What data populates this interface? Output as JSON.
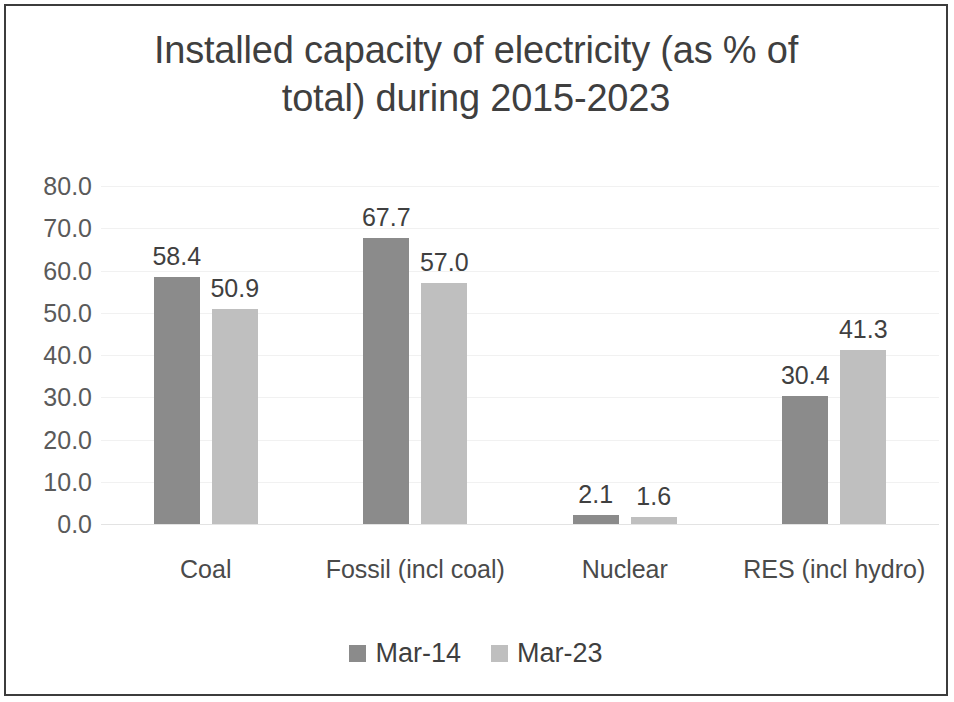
{
  "chart_data": {
    "type": "bar",
    "title": "Installed capacity of electricity (as % of total) during 2015-2023",
    "title_lines": [
      "Installed capacity of electricity (as % of",
      "total) during 2015-2023"
    ],
    "xlabel": "",
    "ylabel": "",
    "categories": [
      "Coal",
      "Fossil (incl coal)",
      "Nuclear",
      "RES (incl hydro)"
    ],
    "series": [
      {
        "name": "Mar-14",
        "color": "#8b8b8b",
        "values": [
          58.4,
          67.7,
          2.1,
          30.4
        ],
        "labels": [
          "58.4",
          "67.7",
          "2.1",
          "30.4"
        ]
      },
      {
        "name": "Mar-23",
        "color": "#bfbfbf",
        "values": [
          50.9,
          57.0,
          1.6,
          41.3
        ],
        "labels": [
          "50.9",
          "57.0",
          "1.6",
          "41.3"
        ]
      }
    ],
    "ylim": [
      0,
      80
    ],
    "ytick_step": 10,
    "ytick_labels": [
      "80.0",
      "70.0",
      "60.0",
      "50.0",
      "40.0",
      "30.0",
      "20.0",
      "10.0",
      "0.0"
    ],
    "ytick_values": [
      80,
      70,
      60,
      50,
      40,
      30,
      20,
      10,
      0
    ],
    "grid": true,
    "grid_color": "#f1f1f1",
    "legend_position": "bottom",
    "data_labels_shown": true,
    "border_color": "#3c3c3c",
    "background": "#ffffff",
    "text_color": "#3f3f3f"
  }
}
